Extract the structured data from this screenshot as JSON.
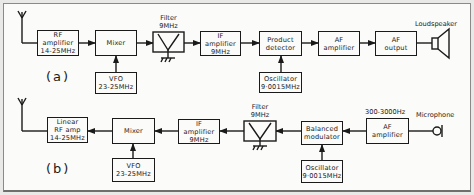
{
  "diagram_a": {
    "label": "(a)",
    "blocks": {
      "rf_amp": [
        "RF",
        "amplifier",
        "14-25MHz"
      ],
      "mixer": [
        "Mixer"
      ],
      "vfo": [
        "VFO",
        "23-25MHz"
      ],
      "filter_label": [
        "Filter",
        "9MHz"
      ],
      "if_amp": [
        "IF",
        "amplifier",
        "9MHz"
      ],
      "product_detector": [
        "Product",
        "detector"
      ],
      "oscillator": [
        "Oscillator",
        "9·0015MHz"
      ],
      "af_amp": [
        "AF",
        "amplifier"
      ],
      "af_output": [
        "AF",
        "output"
      ],
      "loudspeaker": "Loudspeaker"
    }
  },
  "diagram_b": {
    "label": "(b)",
    "blocks": {
      "linear_rf_amp": [
        "Linear",
        "RF amp",
        "14-25MHz"
      ],
      "mixer": [
        "Mixer"
      ],
      "vfo": [
        "VFO",
        "23-25MHz"
      ],
      "if_amp": [
        "IF",
        "amplifier",
        "9MHz"
      ],
      "filter_label": [
        "Filter",
        "9MHz"
      ],
      "balanced_modulator": [
        "Balanced",
        "modulator"
      ],
      "oscillator": [
        "Oscillator",
        "9·0015MHz"
      ],
      "af_amp": [
        "AF",
        "amplifier"
      ],
      "af_range": "300-3000Hz",
      "microphone": "Microphone"
    }
  },
  "colors": {
    "ink": "#1a1a1a",
    "paper": "#fbfbf9",
    "border": "#8a8a88"
  }
}
